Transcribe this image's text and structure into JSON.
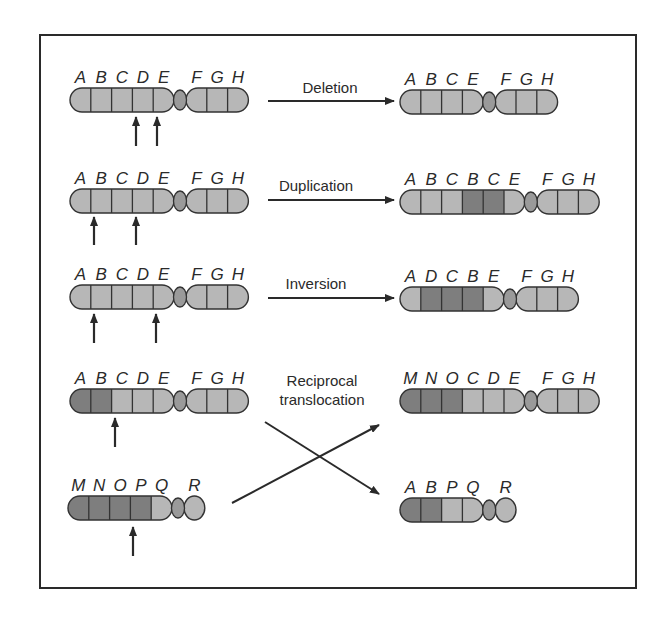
{
  "colors": {
    "light": "#b7b7b7",
    "dark": "#7e7e7e",
    "centromere": "#9a9a9a",
    "stroke": "#333333",
    "arrow": "#2a2a2a",
    "frame": "#2a2a2a"
  },
  "rows": [
    {
      "id": "deletion",
      "operation": "Deletion",
      "before": {
        "genes": [
          "A",
          "B",
          "C",
          "D",
          "E",
          "F",
          "G",
          "H"
        ],
        "shades": [
          "l",
          "l",
          "l",
          "l",
          "l",
          "l",
          "l",
          "l"
        ],
        "centromere_after": 5
      },
      "break_arrows_at": [
        "C|D",
        "D|E"
      ],
      "after": {
        "genes": [
          "A",
          "B",
          "C",
          "E",
          "F",
          "G",
          "H"
        ],
        "shades": [
          "l",
          "l",
          "l",
          "l",
          "l",
          "l",
          "l"
        ],
        "centromere_after": 4
      }
    },
    {
      "id": "duplication",
      "operation": "Duplication",
      "before": {
        "genes": [
          "A",
          "B",
          "C",
          "D",
          "E",
          "F",
          "G",
          "H"
        ],
        "shades": [
          "l",
          "l",
          "l",
          "l",
          "l",
          "l",
          "l",
          "l"
        ],
        "centromere_after": 5
      },
      "break_arrows_at": [
        "A|B",
        "C|D"
      ],
      "after": {
        "genes": [
          "A",
          "B",
          "C",
          "B",
          "C",
          "E",
          "F",
          "G",
          "H"
        ],
        "shades": [
          "l",
          "l",
          "l",
          "d",
          "d",
          "l",
          "l",
          "l",
          "l"
        ],
        "centromere_after": 6
      }
    },
    {
      "id": "inversion",
      "operation": "Inversion",
      "before": {
        "genes": [
          "A",
          "B",
          "C",
          "D",
          "E",
          "F",
          "G",
          "H"
        ],
        "shades": [
          "l",
          "l",
          "l",
          "l",
          "l",
          "l",
          "l",
          "l"
        ],
        "centromere_after": 5
      },
      "break_arrows_at": [
        "A|B",
        "D|E"
      ],
      "after": {
        "genes": [
          "A",
          "D",
          "C",
          "B",
          "E",
          "F",
          "G",
          "H"
        ],
        "shades": [
          "l",
          "d",
          "d",
          "d",
          "l",
          "l",
          "l",
          "l"
        ],
        "centromere_after": 5
      }
    },
    {
      "id": "reciprocal-translocation",
      "operation_lines": [
        "Reciprocal",
        "translocation"
      ],
      "before_1": {
        "genes": [
          "A",
          "B",
          "C",
          "D",
          "E",
          "F",
          "G",
          "H"
        ],
        "shades": [
          "d",
          "d",
          "l",
          "l",
          "l",
          "l",
          "l",
          "l"
        ],
        "centromere_after": 5
      },
      "break_arrows_at_1": [
        "B|C"
      ],
      "before_2": {
        "genes": [
          "M",
          "N",
          "O",
          "P",
          "Q",
          "R"
        ],
        "shades": [
          "d",
          "d",
          "d",
          "d",
          "l",
          "l"
        ],
        "centromere_after": 5
      },
      "break_arrows_at_2": [
        "O|P"
      ],
      "after_1": {
        "genes": [
          "M",
          "N",
          "O",
          "C",
          "D",
          "E",
          "F",
          "G",
          "H"
        ],
        "shades": [
          "d",
          "d",
          "d",
          "l",
          "l",
          "l",
          "l",
          "l",
          "l"
        ],
        "centromere_after": 6
      },
      "after_2": {
        "genes": [
          "A",
          "B",
          "P",
          "Q",
          "R"
        ],
        "shades": [
          "d",
          "d",
          "l",
          "l",
          "l"
        ],
        "centromere_after": 4
      }
    }
  ]
}
